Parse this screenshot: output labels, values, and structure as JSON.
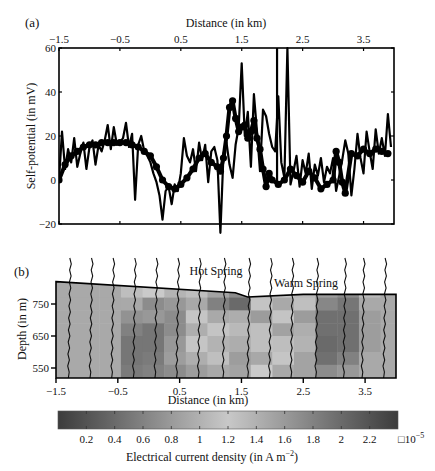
{
  "figure": {
    "panel_a_label": "(a)",
    "panel_b_label": "(b)"
  },
  "chart_data": [
    {
      "id": "panel-a",
      "type": "line",
      "title": "",
      "panel_label": "(a)",
      "xlabel": "Distance (in km)",
      "xlabel_position": "top",
      "ylabel": "Self-potential (in mV)",
      "xlim": [
        -1.5,
        4.0
      ],
      "ylim": [
        -20,
        60
      ],
      "xticks": [
        -1.5,
        -0.5,
        0.5,
        1.5,
        2.5,
        3.5
      ],
      "xtick_labels": [
        "−1.5",
        "−0.5",
        "0.5",
        "1.5",
        "2.5",
        "3.5"
      ],
      "yticks": [
        -20,
        0,
        20,
        40,
        60
      ],
      "ytick_labels": [
        "−20",
        "0",
        "20",
        "40",
        "60"
      ],
      "grid": false,
      "series": [
        {
          "name": "Self-potential (raw)",
          "style": "line",
          "x": [
            -1.5,
            -1.45,
            -1.4,
            -1.35,
            -1.3,
            -1.25,
            -1.2,
            -1.15,
            -1.1,
            -1.05,
            -1.0,
            -0.95,
            -0.9,
            -0.85,
            -0.8,
            -0.75,
            -0.7,
            -0.65,
            -0.6,
            -0.55,
            -0.5,
            -0.45,
            -0.4,
            -0.35,
            -0.3,
            -0.25,
            -0.2,
            -0.15,
            -0.1,
            -0.05,
            0.0,
            0.05,
            0.1,
            0.15,
            0.2,
            0.25,
            0.3,
            0.35,
            0.4,
            0.45,
            0.5,
            0.55,
            0.6,
            0.65,
            0.7,
            0.75,
            0.8,
            0.85,
            0.9,
            0.95,
            1.0,
            1.05,
            1.1,
            1.15,
            1.2,
            1.25,
            1.3,
            1.35,
            1.4,
            1.45,
            1.5,
            1.55,
            1.6,
            1.65,
            1.7,
            1.75,
            1.8,
            1.85,
            1.9,
            1.95,
            2.0,
            2.05,
            2.1,
            2.15,
            2.2,
            2.25,
            2.3,
            2.35,
            2.4,
            2.45,
            2.5,
            2.55,
            2.6,
            2.65,
            2.7,
            2.75,
            2.8,
            2.85,
            2.9,
            2.95,
            3.0,
            3.05,
            3.1,
            3.15,
            3.2,
            3.25,
            3.3,
            3.35,
            3.4,
            3.45,
            3.5,
            3.55,
            3.6,
            3.65,
            3.7,
            3.75,
            3.8,
            3.85,
            3.9,
            3.95
          ],
          "y": [
            0,
            22,
            5,
            14,
            8,
            19,
            6,
            12,
            17,
            5,
            15,
            18,
            7,
            16,
            13,
            18,
            25,
            14,
            24,
            16,
            17,
            19,
            26,
            15,
            21,
            -9,
            16,
            20,
            13,
            11,
            8,
            3,
            -1,
            -7,
            -18,
            -5,
            -3,
            -11,
            -2,
            -5,
            3,
            19,
            11,
            8,
            14,
            4,
            17,
            9,
            16,
            -1,
            13,
            15,
            9,
            -24,
            12,
            17,
            7,
            1,
            16,
            24,
            53,
            20,
            31,
            6,
            39,
            22,
            4,
            32,
            29,
            21,
            15,
            13,
            38,
            8,
            1,
            60,
            -2,
            4,
            11,
            -3,
            9,
            3,
            12,
            -4,
            7,
            2,
            10,
            -1,
            6,
            3,
            10,
            -5,
            2,
            9,
            18,
            12,
            -7,
            5,
            21,
            10,
            3,
            22,
            13,
            5,
            23,
            12,
            19,
            11,
            30,
            15
          ],
          "color": "#000000"
        },
        {
          "name": "Self-potential (smoothed markers)",
          "style": "markers",
          "x": [
            -1.5,
            -1.4,
            -1.3,
            -1.2,
            -1.1,
            -1.0,
            -0.9,
            -0.8,
            -0.7,
            -0.6,
            -0.5,
            -0.4,
            -0.3,
            -0.2,
            -0.1,
            0.0,
            0.1,
            0.2,
            0.3,
            0.4,
            0.5,
            0.6,
            0.7,
            0.8,
            0.9,
            1.0,
            1.1,
            1.15,
            1.2,
            1.25,
            1.3,
            1.35,
            1.4,
            1.45,
            1.5,
            1.55,
            1.6,
            1.65,
            1.7,
            1.75,
            1.8,
            1.85,
            1.9,
            1.95,
            2.0,
            2.1,
            2.2,
            2.3,
            2.4,
            2.5,
            2.6,
            2.7,
            2.8,
            2.9,
            3.0,
            3.05,
            3.1,
            3.15,
            3.2,
            3.3,
            3.4,
            3.5,
            3.6,
            3.7,
            3.8,
            3.9
          ],
          "y": [
            0,
            7,
            11,
            13,
            15,
            16,
            16,
            17,
            17,
            17,
            17,
            17,
            16,
            15,
            13,
            11,
            6,
            0,
            -3,
            -4,
            -2,
            1,
            5,
            10,
            12,
            8,
            6,
            4,
            10,
            20,
            33,
            36,
            28,
            22,
            24,
            25,
            19,
            22,
            27,
            19,
            14,
            5,
            -3,
            3,
            0,
            -2,
            0,
            5,
            2,
            -1,
            4,
            1,
            -4,
            -2,
            0,
            13,
            8,
            -1,
            -6,
            12,
            11,
            14,
            12,
            14,
            13,
            12
          ],
          "color": "#000000"
        },
        {
          "name": "Vertical marker line",
          "style": "vline",
          "x": [
            2.08
          ],
          "y_range": [
            -3,
            60
          ],
          "color": "#000000"
        }
      ]
    },
    {
      "id": "panel-b",
      "type": "heatmap",
      "title": "",
      "panel_label": "(b)",
      "xlabel": "Distance (in km)",
      "ylabel": "Depth (in m)",
      "xlim": [
        -1.5,
        4.0
      ],
      "ylim": [
        510,
        820
      ],
      "xticks": [
        -1.5,
        -0.5,
        0.5,
        1.5,
        2.5,
        3.5
      ],
      "xtick_labels": [
        "−1.5",
        "−0.5",
        "0.5",
        "1.5",
        "2.5",
        "3.5"
      ],
      "yticks": [
        550,
        650,
        750
      ],
      "ytick_labels": [
        "550",
        "650",
        "750"
      ],
      "annotations": [
        {
          "text": "Hot Spring",
          "x": 1.45,
          "y": 830
        },
        {
          "text": "Warm Spring",
          "x": 2.85,
          "y": 800
        }
      ],
      "topography": {
        "x": [
          -1.5,
          1.4,
          1.6,
          2.5,
          4.0
        ],
        "y": [
          820,
          785,
          772,
          780,
          780
        ]
      },
      "columns_x": [
        -1.5,
        -1.15,
        -0.8,
        -0.45,
        -0.1,
        0.25,
        0.6,
        0.95,
        1.3,
        1.65,
        2.0,
        2.35,
        2.7,
        3.05,
        3.4,
        3.75,
        4.0
      ],
      "rows_y": [
        820,
        770,
        730,
        690,
        650,
        600,
        560,
        510
      ],
      "grid_values": [
        [
          1.0,
          1.0,
          1.0,
          1.45,
          1.35,
          1.1,
          1.45,
          0.95,
          0.75,
          0.95,
          1.4,
          1.15,
          0.9,
          0.75,
          1.15,
          1.0
        ],
        [
          1.0,
          1.0,
          1.0,
          1.0,
          0.75,
          0.85,
          1.0,
          0.65,
          0.45,
          1.4,
          1.0,
          1.2,
          0.7,
          0.55,
          1.0,
          1.0
        ],
        [
          1.0,
          1.0,
          1.0,
          0.8,
          0.85,
          0.75,
          1.25,
          1.0,
          1.6,
          1.75,
          1.4,
          1.75,
          0.5,
          0.5,
          0.9,
          1.0
        ],
        [
          1.0,
          1.0,
          1.0,
          0.65,
          0.55,
          0.75,
          1.05,
          1.4,
          1.5,
          1.2,
          1.7,
          1.05,
          0.5,
          0.5,
          0.9,
          1.0
        ],
        [
          1.0,
          1.0,
          1.0,
          0.55,
          0.55,
          0.85,
          1.25,
          1.55,
          1.6,
          1.2,
          1.45,
          1.55,
          0.45,
          0.5,
          0.9,
          1.0
        ],
        [
          1.0,
          1.0,
          1.0,
          0.55,
          0.6,
          0.9,
          1.05,
          1.2,
          0.9,
          1.65,
          1.25,
          0.95,
          0.5,
          0.65,
          1.0,
          1.0
        ],
        [
          1.0,
          1.0,
          1.0,
          0.6,
          0.65,
          0.75,
          0.9,
          1.0,
          0.95,
          1.35,
          1.0,
          0.95,
          0.75,
          0.85,
          1.0,
          1.0
        ]
      ],
      "current_vectors_x": [
        -1.3,
        -0.95,
        -0.6,
        -0.25,
        0.1,
        0.45,
        0.8,
        1.2,
        1.6,
        1.95,
        2.3,
        2.7,
        3.15,
        3.45,
        3.8
      ],
      "colorbar": {
        "label": "Electrical current density (in A m−2)",
        "label_main": "Electrical current density (in A m",
        "label_sup": "−2",
        "label_end": ")",
        "min": 0,
        "max": 2.4,
        "ticks": [
          0.2,
          0.4,
          0.6,
          0.8,
          1.0,
          1.2,
          1.4,
          1.6,
          1.8,
          2.0,
          2.2
        ],
        "tick_labels": [
          "0.2",
          "0.4",
          "0.6",
          "0.8",
          "1",
          "1.2",
          "1.4",
          "1.6",
          "1.8",
          "2",
          "2.2"
        ],
        "multiplier_box": "□",
        "multiplier": "10",
        "multiplier_exp": "−5",
        "gradient_stops": [
          "#3c3c3c",
          "#6a6a6a",
          "#9a9a9a",
          "#c8c8c8",
          "#9a9a9a",
          "#6a6a6a",
          "#3c3c3c"
        ]
      }
    }
  ]
}
